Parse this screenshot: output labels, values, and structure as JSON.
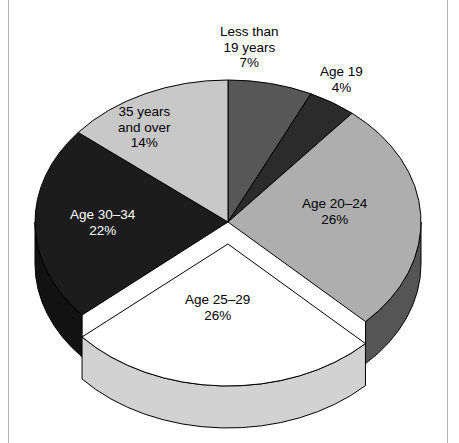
{
  "figure": {
    "background_color": "#ffffff",
    "frame_color": "#b4b4b4",
    "outline_color": "#000000"
  },
  "chart_data": {
    "type": "pie",
    "title": "",
    "subtitle": "",
    "xlabel": "",
    "ylabel": "",
    "legend_position": "none",
    "grid": false,
    "units": "percent",
    "total": 99,
    "start_angle_deg": 0,
    "direction": "clockwise",
    "three_d": true,
    "categories": [
      "Less than 19 years",
      "Age 19",
      "Age 20–24",
      "Age 25–29",
      "Age 30–34",
      "35 years and over"
    ],
    "values": [
      7,
      4,
      26,
      26,
      22,
      14
    ],
    "slices": [
      {
        "id": "less-than-19",
        "label_lines": [
          "Less than",
          "19 years"
        ],
        "value_text": "7%",
        "value": 7,
        "color": "#575757",
        "side_color": "#3c3c3c",
        "text_color": "#000000",
        "exploded": false,
        "label_x": 220,
        "label_y": 24,
        "label_align": "outside-top"
      },
      {
        "id": "age-19",
        "label_lines": [
          "Age 19"
        ],
        "value_text": "4%",
        "value": 4,
        "color": "#2b2b2b",
        "side_color": "#1e1e1e",
        "text_color": "#000000",
        "exploded": false,
        "label_x": 320,
        "label_y": 64,
        "label_align": "outside-top-right"
      },
      {
        "id": "age-20-24",
        "label_lines": [
          "Age 20–24"
        ],
        "value_text": "26%",
        "value": 26,
        "color": "#aeaeae",
        "side_color": "#555555",
        "text_color": "#000000",
        "exploded": false,
        "label_x": 302,
        "label_y": 196,
        "label_align": "inside"
      },
      {
        "id": "age-25-29",
        "label_lines": [
          "Age 25–29"
        ],
        "value_text": "26%",
        "value": 26,
        "color": "#ffffff",
        "side_color": "#d2d2d2",
        "text_color": "#000000",
        "exploded": true,
        "label_x": 185,
        "label_y": 292,
        "label_align": "inside"
      },
      {
        "id": "age-30-34",
        "label_lines": [
          "Age 30–34"
        ],
        "value_text": "22%",
        "value": 22,
        "color": "#1c1c1c",
        "side_color": "#121212",
        "text_color": "#ffffff",
        "exploded": false,
        "label_x": 70,
        "label_y": 207,
        "label_align": "inside"
      },
      {
        "id": "35-and-over",
        "label_lines": [
          "35 years",
          "and over"
        ],
        "value_text": "14%",
        "value": 14,
        "color": "#c8c8c8",
        "side_color": "#909090",
        "text_color": "#000000",
        "exploded": false,
        "label_x": 118,
        "label_y": 104,
        "label_align": "inside"
      }
    ],
    "geometry": {
      "center_x": 228,
      "center_y": 222,
      "radius_x": 193,
      "radius_y": 142,
      "depth": 42,
      "explode_offset_y": 22
    }
  }
}
